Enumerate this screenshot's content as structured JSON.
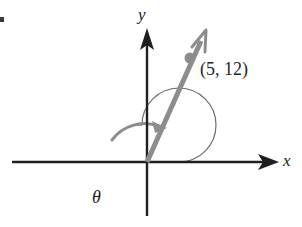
{
  "figure": {
    "background_color": "#ffffff",
    "width": 302,
    "height": 227
  },
  "axes": {
    "x_label": "x",
    "y_label": "y",
    "axis_color": "#1f1f1f",
    "origin": {
      "x": 147,
      "y": 162
    },
    "x_axis": {
      "start_x": 12,
      "end_x": 278,
      "y": 162,
      "arrow": "right"
    },
    "y_axis": {
      "x": 147,
      "start_y": 215,
      "end_y": 30,
      "arrow": "up"
    }
  },
  "vector": {
    "label": "(5, 12)",
    "color": "#8d8d8d",
    "components": {
      "x": 5,
      "y": 12
    },
    "tail": {
      "x": 147,
      "y": 162
    },
    "tip": {
      "x": 206,
      "y": 29
    },
    "point_marker": {
      "x": 190,
      "y": 58
    },
    "arrow_style": "open"
  },
  "angle": {
    "label": "θ",
    "arc_color": "#6e6e6e",
    "arc_center": {
      "x": 142,
      "y": 162
    },
    "arc_radius": 37,
    "direction": "counterclockwise",
    "sweep_description": "more than one full revolution from positive x-axis to the vector",
    "arrow_at_end": true
  },
  "edge_artifact": {
    "name": "page-edge-mark",
    "color": "#3a3a3a"
  }
}
